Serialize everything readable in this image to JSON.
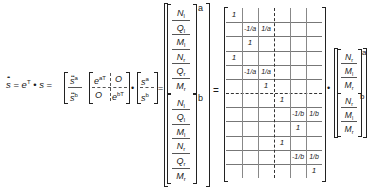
{
  "equation": {
    "lhs": {
      "s_ddot": "s",
      "equals": "=",
      "eT": "e",
      "eT_sup": "T",
      "dot": "•",
      "s": "s",
      "sa": "s",
      "sa_sup": "a",
      "sb": "s",
      "sb_sup": "b"
    },
    "block_matrix": {
      "top_left": "e",
      "top_left_sup": "aT",
      "top_right": "O",
      "bottom_left": "O",
      "bottom_right": "e",
      "bottom_right_sup": "bT"
    },
    "s_vec": {
      "top": "s",
      "top_sup": "a",
      "bottom": "s",
      "bottom_sup": "b"
    },
    "state_vector": {
      "a_label": "a",
      "b_label": "b",
      "rows": [
        {
          "sym": "N",
          "sub": "l"
        },
        {
          "sym": "Q",
          "sub": "l"
        },
        {
          "sym": "M",
          "sub": "l"
        },
        {
          "sym": "N",
          "sub": "r"
        },
        {
          "sym": "Q",
          "sub": "r"
        },
        {
          "sym": "M",
          "sub": "r"
        },
        {
          "sym": "N",
          "sub": "l"
        },
        {
          "sym": "Q",
          "sub": "l"
        },
        {
          "sym": "M",
          "sub": "l"
        },
        {
          "sym": "N",
          "sub": "r"
        },
        {
          "sym": "Q",
          "sub": "r"
        },
        {
          "sym": "M",
          "sub": "r"
        }
      ]
    },
    "equals2": "=",
    "transform_matrix": {
      "rows": 12,
      "cols": 6,
      "entries": [
        {
          "r": 0,
          "c": 0,
          "v": "1"
        },
        {
          "r": 1,
          "c": 1,
          "v": "-1/a"
        },
        {
          "r": 1,
          "c": 2,
          "v": "1/a"
        },
        {
          "r": 2,
          "c": 1,
          "v": "1"
        },
        {
          "r": 3,
          "c": 0,
          "v": "1"
        },
        {
          "r": 4,
          "c": 1,
          "v": "-1/a"
        },
        {
          "r": 4,
          "c": 2,
          "v": "1/a"
        },
        {
          "r": 5,
          "c": 2,
          "v": "1"
        },
        {
          "r": 6,
          "c": 3,
          "v": "1"
        },
        {
          "r": 7,
          "c": 4,
          "v": "-1/b"
        },
        {
          "r": 7,
          "c": 5,
          "v": "1/b"
        },
        {
          "r": 8,
          "c": 4,
          "v": "1"
        },
        {
          "r": 9,
          "c": 3,
          "v": "1"
        },
        {
          "r": 10,
          "c": 4,
          "v": "-1/b"
        },
        {
          "r": 10,
          "c": 5,
          "v": "1/b"
        },
        {
          "r": 11,
          "c": 5,
          "v": "1"
        }
      ]
    },
    "dot2": "•",
    "reduced_vector": {
      "a_label": "a",
      "b_label": "b",
      "rows": [
        {
          "sym": "N",
          "sub": "r"
        },
        {
          "sym": "M",
          "sub": "l"
        },
        {
          "sym": "M",
          "sub": "r"
        },
        {
          "sym": "N",
          "sub": "r"
        },
        {
          "sym": "M",
          "sub": "l"
        },
        {
          "sym": "M",
          "sub": "r"
        }
      ]
    }
  }
}
